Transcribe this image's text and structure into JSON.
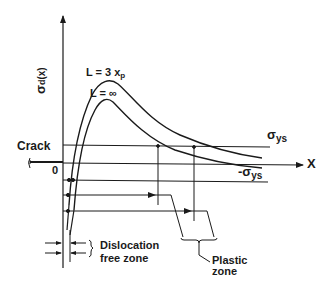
{
  "diagram": {
    "axes": {
      "y_label_main": "σ",
      "y_label_sub": "d",
      "y_label_arg": "(x)",
      "x_label": "X",
      "origin_label": "0"
    },
    "curves": [
      {
        "label_main": "L = 3 x",
        "label_sub": "p",
        "description": "upper stress curve"
      },
      {
        "label_main": "L = ∞",
        "label_sub": "",
        "description": "lower stress curve"
      }
    ],
    "levels": {
      "positive_yield_main": "σ",
      "positive_yield_sub": "ys",
      "negative_yield_main": "-σ",
      "negative_yield_sub": "ys"
    },
    "annotations": {
      "crack": "Crack",
      "dislocation_line1": "Dislocation",
      "dislocation_line2": "free zone",
      "plastic_line1": "Plastic",
      "plastic_line2": "zone"
    },
    "colors": {
      "ink": "#1a1a1a",
      "background": "#ffffff"
    }
  }
}
